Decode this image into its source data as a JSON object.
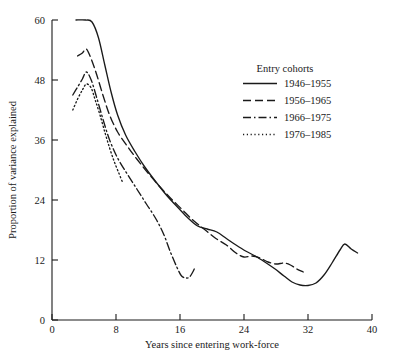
{
  "chart_data": {
    "type": "line",
    "title": "",
    "xlabel": "Years since entering work-force",
    "ylabel": "Proportion of variance explained",
    "xlim": [
      0,
      40
    ],
    "ylim": [
      0,
      60
    ],
    "xticks": [
      0,
      8,
      16,
      24,
      32,
      40
    ],
    "yticks": [
      0,
      12,
      24,
      36,
      48,
      60
    ],
    "xticklabels": [
      "0",
      "8",
      "16",
      "24",
      "32",
      "40"
    ],
    "yticklabels": [
      "0",
      "12",
      "24",
      "36",
      "48",
      "60"
    ],
    "grid": false,
    "legend_position": "upper right",
    "legend_title": "Entry cohorts",
    "series": [
      {
        "name": "1946–1955",
        "linestyle": "solid",
        "color": "#1a1a1a",
        "points": [
          [
            3.0,
            60.0
          ],
          [
            4.2,
            60.0
          ],
          [
            5.0,
            59.6
          ],
          [
            5.8,
            56.5
          ],
          [
            6.6,
            51.0
          ],
          [
            7.4,
            45.5
          ],
          [
            8.2,
            41.0
          ],
          [
            9.2,
            37.0
          ],
          [
            10.4,
            33.6
          ],
          [
            11.6,
            30.6
          ],
          [
            13.0,
            27.6
          ],
          [
            14.4,
            24.8
          ],
          [
            15.8,
            22.4
          ],
          [
            17.0,
            20.4
          ],
          [
            18.2,
            18.8
          ],
          [
            19.4,
            18.2
          ],
          [
            20.6,
            17.6
          ],
          [
            21.8,
            16.3
          ],
          [
            23.0,
            15.0
          ],
          [
            24.2,
            13.8
          ],
          [
            25.4,
            12.8
          ],
          [
            26.6,
            11.6
          ],
          [
            27.8,
            10.3
          ],
          [
            29.0,
            8.8
          ],
          [
            30.0,
            7.6
          ],
          [
            31.0,
            7.0
          ],
          [
            32.0,
            6.9
          ],
          [
            33.0,
            7.4
          ],
          [
            34.0,
            9.0
          ],
          [
            35.0,
            11.4
          ],
          [
            36.0,
            14.0
          ],
          [
            36.6,
            15.2
          ],
          [
            37.4,
            14.2
          ],
          [
            38.2,
            13.4
          ]
        ]
      },
      {
        "name": "1956–1965",
        "linestyle": "dashed",
        "color": "#1a1a1a",
        "points": [
          [
            3.2,
            52.8
          ],
          [
            3.8,
            53.4
          ],
          [
            4.3,
            54.2
          ],
          [
            4.9,
            52.2
          ],
          [
            5.6,
            49.0
          ],
          [
            6.4,
            44.8
          ],
          [
            7.2,
            41.0
          ],
          [
            8.2,
            37.6
          ],
          [
            9.4,
            34.8
          ],
          [
            10.6,
            32.2
          ],
          [
            12.0,
            29.4
          ],
          [
            13.4,
            26.8
          ],
          [
            14.8,
            24.4
          ],
          [
            16.2,
            22.2
          ],
          [
            17.6,
            20.0
          ],
          [
            19.0,
            18.2
          ],
          [
            20.4,
            16.4
          ],
          [
            21.8,
            15.0
          ],
          [
            23.0,
            13.4
          ],
          [
            24.0,
            12.6
          ],
          [
            25.0,
            12.8
          ],
          [
            26.0,
            12.4
          ],
          [
            27.0,
            11.6
          ],
          [
            28.0,
            11.2
          ],
          [
            29.0,
            11.4
          ],
          [
            29.8,
            11.0
          ],
          [
            30.6,
            10.2
          ],
          [
            31.4,
            9.6
          ]
        ]
      },
      {
        "name": "1966–1975",
        "linestyle": "dashdot",
        "color": "#1a1a1a",
        "points": [
          [
            2.6,
            45.0
          ],
          [
            3.2,
            46.6
          ],
          [
            3.8,
            48.2
          ],
          [
            4.3,
            49.6
          ],
          [
            4.9,
            48.0
          ],
          [
            5.6,
            44.4
          ],
          [
            6.4,
            40.0
          ],
          [
            7.2,
            36.0
          ],
          [
            8.2,
            32.4
          ],
          [
            9.4,
            29.2
          ],
          [
            10.6,
            26.2
          ],
          [
            11.8,
            23.2
          ],
          [
            13.0,
            20.2
          ],
          [
            14.0,
            17.0
          ],
          [
            14.8,
            13.6
          ],
          [
            15.6,
            10.6
          ],
          [
            16.2,
            8.8
          ],
          [
            16.8,
            8.4
          ],
          [
            17.2,
            8.6
          ],
          [
            17.6,
            9.6
          ],
          [
            17.9,
            10.6
          ]
        ]
      },
      {
        "name": "1976–1985",
        "linestyle": "dotted",
        "color": "#1a1a1a",
        "points": [
          [
            2.6,
            42.0
          ],
          [
            3.2,
            44.2
          ],
          [
            3.8,
            46.0
          ],
          [
            4.3,
            47.2
          ],
          [
            4.9,
            46.4
          ],
          [
            5.4,
            44.0
          ],
          [
            6.0,
            41.0
          ],
          [
            6.6,
            37.6
          ],
          [
            7.2,
            34.4
          ],
          [
            7.8,
            31.6
          ],
          [
            8.4,
            29.2
          ],
          [
            8.8,
            27.6
          ]
        ]
      }
    ]
  },
  "axes": {
    "x_axis_title": "Years since entering work-force",
    "y_axis_title": "Proportion of variance explained"
  },
  "legend": {
    "title": "Entry cohorts",
    "entries": [
      {
        "label": "1946–1955",
        "style": "solid"
      },
      {
        "label": "1956–1965",
        "style": "dashed"
      },
      {
        "label": "1966–1975",
        "style": "dashdot"
      },
      {
        "label": "1976–1985",
        "style": "dotted"
      }
    ]
  }
}
